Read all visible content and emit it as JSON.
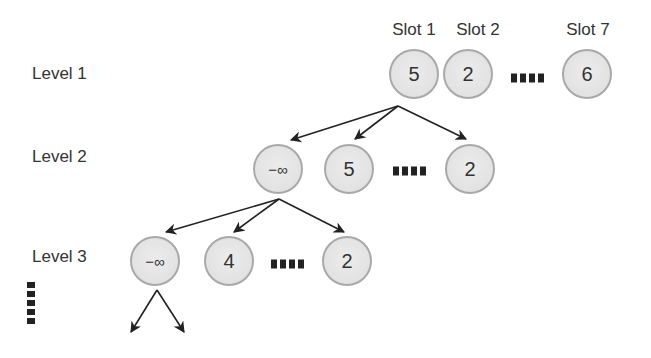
{
  "diagram": {
    "colors": {
      "node_fill": "#e4e4e4",
      "node_border": "#a9a9a9",
      "text": "#333333",
      "arrow": "#222222",
      "background": "#ffffff"
    },
    "slot_labels": [
      "Slot 1",
      "Slot 2",
      "Slot 7"
    ],
    "levels": [
      {
        "label": "Level 1",
        "nodes": [
          {
            "slot": "Slot 1",
            "value": "5"
          },
          {
            "slot": "Slot 2",
            "value": "2"
          },
          {
            "slot": "Slot 7",
            "value": "6"
          }
        ],
        "ellipsis": "...."
      },
      {
        "label": "Level 2",
        "nodes": [
          {
            "value": "−∞"
          },
          {
            "value": "5"
          },
          {
            "value": "2"
          }
        ],
        "ellipsis": "...."
      },
      {
        "label": "Level 3",
        "nodes": [
          {
            "value": "−∞"
          },
          {
            "value": "4"
          },
          {
            "value": "2"
          }
        ],
        "ellipsis": "...."
      }
    ],
    "continuation": "vertical-ellipsis",
    "edges": [
      {
        "from": "L1-slot1",
        "to": "L2-node1"
      },
      {
        "from": "L1-slot1",
        "to": "L2-node2"
      },
      {
        "from": "L1-slot1",
        "to": "L2-node3"
      },
      {
        "from": "L2-node1",
        "to": "L3-node1"
      },
      {
        "from": "L2-node1",
        "to": "L3-node2"
      },
      {
        "from": "L2-node1",
        "to": "L3-node3"
      },
      {
        "from": "L3-node1",
        "to": "child-left"
      },
      {
        "from": "L3-node1",
        "to": "child-right"
      }
    ]
  }
}
